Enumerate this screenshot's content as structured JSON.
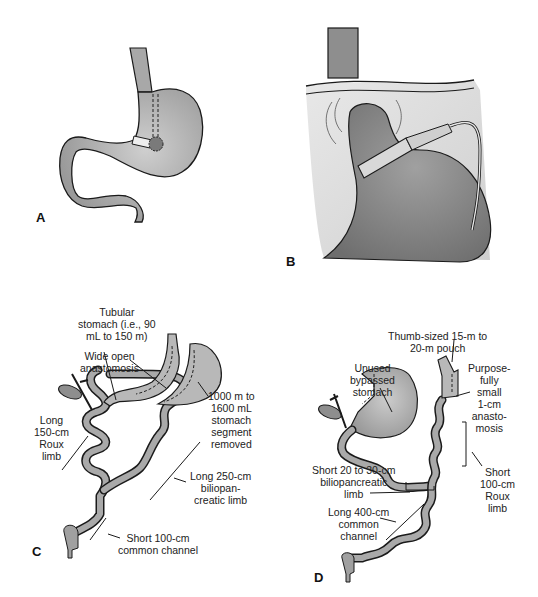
{
  "figure": {
    "panels": [
      {
        "id": "A",
        "letter": "A",
        "description": "Stomach with adjustable band and stapled line",
        "labels": []
      },
      {
        "id": "B",
        "letter": "B",
        "description": "Adjustable gastric band placed around upper stomach with tubing",
        "labels": []
      },
      {
        "id": "C",
        "letter": "C",
        "description": "Biliopancreatic diversion with sleeve gastrectomy",
        "labels": {
          "tubular_stomach": [
            "Tubular",
            "stomach (i.e., 90",
            "mL to 150 m)"
          ],
          "wide_open_anastomosis": [
            "Wide open",
            "anastomosis"
          ],
          "stomach_removed": [
            "1000 m to",
            "1600 mL",
            "stomach",
            "segment",
            "removed"
          ],
          "roux_limb": [
            "Long",
            "150-cm",
            "Roux",
            "limb"
          ],
          "biliopancreatic_limb": [
            "Long 250-cm",
            "biliopan-",
            "creatic limb"
          ],
          "common_channel": [
            "Short 100-cm",
            "common channel"
          ]
        }
      },
      {
        "id": "D",
        "letter": "D",
        "description": "Distal gastric bypass with small pouch",
        "labels": {
          "pouch": [
            "Thumb-sized 15-m to",
            "20-m pouch"
          ],
          "bypassed_stomach": [
            "Unused",
            "bypassed",
            "stomach"
          ],
          "anastomosis": [
            "Purpose-",
            "fully",
            "small",
            "1-cm",
            "anasto-",
            "mosis"
          ],
          "roux_limb": [
            "Short",
            "100-cm",
            "Roux",
            "limb"
          ],
          "biliopancreatic_limb": [
            "Short 20 to 30-cm",
            "biliopancreatic",
            "limb"
          ],
          "common_channel": [
            "Long 400-cm",
            "common",
            "channel"
          ]
        }
      }
    ],
    "colors": {
      "organ_fill": "#a9a9a9",
      "organ_light": "#c8c8c8",
      "outline": "#1a1a1a",
      "background": "#ffffff"
    }
  }
}
